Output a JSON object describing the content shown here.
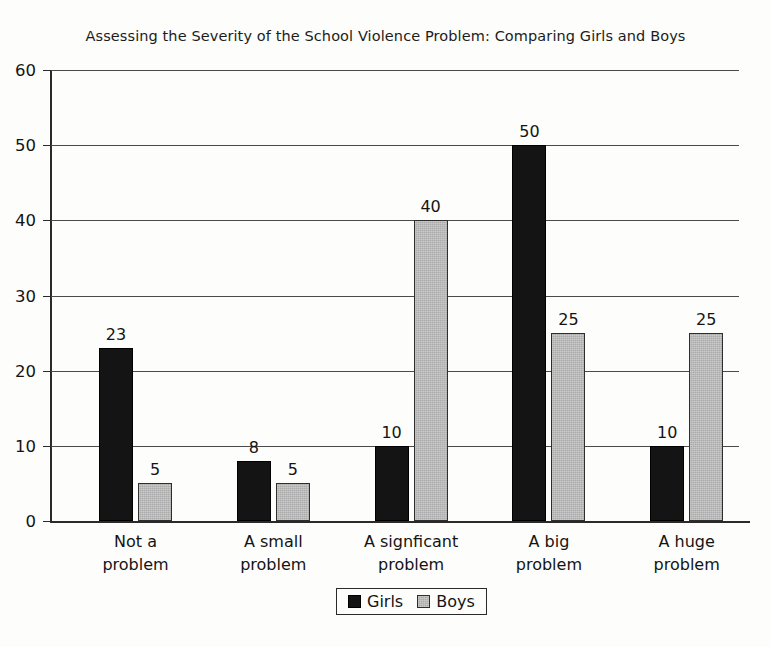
{
  "chart_data": {
    "type": "bar",
    "title": "Assessing the Severity of the School Violence Problem: Comparing Girls and Boys",
    "xlabel": "",
    "ylabel": "",
    "ylim": [
      0,
      60
    ],
    "ytick_step": 10,
    "yticks": [
      "0",
      "10",
      "20",
      "30",
      "40",
      "50",
      "60"
    ],
    "grid": true,
    "legend_position": "bottom-center",
    "categories": [
      "Not a\nproblem",
      "A small\nproblem",
      "A signficant\nproblem",
      "A big\nproblem",
      "A huge\nproblem"
    ],
    "category_lines": [
      [
        "Not a",
        "problem"
      ],
      [
        "A small",
        "problem"
      ],
      [
        "A signficant",
        "problem"
      ],
      [
        "A big",
        "problem"
      ],
      [
        "A huge",
        "problem"
      ]
    ],
    "series": [
      {
        "name": "Girls",
        "color": "#141414",
        "values": [
          23,
          8,
          10,
          50,
          10
        ]
      },
      {
        "name": "Boys",
        "color": "#ababab",
        "values": [
          5,
          5,
          40,
          25,
          25
        ]
      }
    ],
    "data_labels": {
      "girls": [
        "23",
        "8",
        "10",
        "50",
        "10"
      ],
      "boys": [
        "5",
        "5",
        "40",
        "25",
        "25"
      ]
    }
  },
  "legend": {
    "entries": [
      {
        "label": "Girls"
      },
      {
        "label": "Boys"
      }
    ]
  }
}
